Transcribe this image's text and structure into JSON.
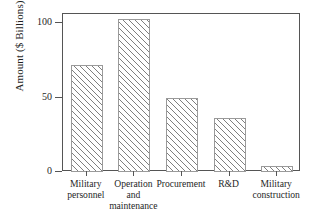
{
  "chart_data": {
    "type": "bar",
    "title": "",
    "xlabel": "",
    "ylabel": "Amount ($ Billions)",
    "categories": [
      "Military personnel",
      "Operation and maintenance",
      "Procurement",
      "R&D",
      "Military construction"
    ],
    "category_lines": [
      [
        "Military",
        "personnel"
      ],
      [
        "Operation",
        "and",
        "maintenance"
      ],
      [
        "Procurement"
      ],
      [
        "R&D"
      ],
      [
        "Military",
        "construction"
      ]
    ],
    "values": [
      72,
      103,
      50,
      36,
      4
    ],
    "ylim": [
      0,
      112
    ],
    "yticks": [
      0,
      50,
      100
    ],
    "ytick_labels": [
      "0",
      "50",
      "100"
    ],
    "grid": false,
    "legend": false,
    "bar_fill": "#ffffff",
    "bar_edge": "#9a9a9a",
    "bar_hatch": "diagonal-lines",
    "frame_color": "#555555",
    "text_color": "#1f1f1f"
  }
}
